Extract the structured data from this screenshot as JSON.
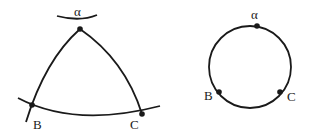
{
  "diagram": {
    "left_figure": {
      "type": "curved-triangle",
      "labels": {
        "top": "α",
        "left": "B",
        "right": "C"
      }
    },
    "right_figure": {
      "type": "circle",
      "labels": {
        "top": "α",
        "left": "B",
        "right": "C"
      }
    },
    "colors": {
      "stroke": "#1a1a1a",
      "background": "#ffffff"
    }
  }
}
